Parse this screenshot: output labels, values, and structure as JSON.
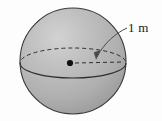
{
  "figure": {
    "kind": "geometry-diagram",
    "caption": "",
    "background_color": "#fdfdfd"
  },
  "sphere": {
    "name": "sphere-body",
    "center": {
      "x": 73,
      "y": 61
    },
    "radius": 53,
    "fill_color": "#b2b2b2",
    "highlight_color": "#cfcfcf",
    "shadow_color": "#9a9a9a",
    "outline_color": "#3a3a3a",
    "outline_width": 1.1
  },
  "equator": {
    "name": "equator-ellipse",
    "center": {
      "x": 73,
      "y": 63
    },
    "rx": 53,
    "ry": 15,
    "front_arc_style": "solid",
    "back_arc_style": "dashed",
    "stroke_color": "#2e2e2e",
    "dash_pattern": "4 3"
  },
  "center_point": {
    "name": "center-dot",
    "x": 70,
    "y": 63,
    "radius": 3.1,
    "color": "#111111"
  },
  "radius_line": {
    "name": "radius-dashed-line",
    "from": {
      "x": 74,
      "y": 63
    },
    "to": {
      "x": 124,
      "y": 62
    },
    "style": "dashed",
    "dash_pattern": "4 3",
    "stroke_color": "#2e2e2e"
  },
  "leader": {
    "name": "leader-line",
    "style": "curved-arrow",
    "stroke_color": "#4a4a4a",
    "arrow_tip": {
      "x": 96,
      "y": 58
    },
    "start": {
      "x": 127,
      "y": 28
    }
  },
  "dimension_label": {
    "name": "radius-dimension-label",
    "text": "1 m",
    "value": "1",
    "unit": "m",
    "color": "#1a1a1a",
    "position": {
      "x": 128,
      "y": 21
    }
  }
}
